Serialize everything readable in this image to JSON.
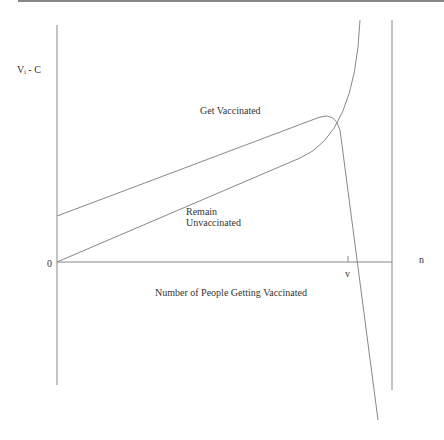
{
  "diagram": {
    "y_axis_label": "Vᵢ - C",
    "origin_label": "0",
    "x_axis_end_label": "n",
    "x_axis_title": "Number of People Getting Vaccinated",
    "tick_label": "v",
    "curves": [
      {
        "name": "Get Vaccinated",
        "label": "Get Vaccinated"
      },
      {
        "name": "Remain Unvaccinated",
        "label_line1": "Remain",
        "label_line2": "Unvaccinated"
      }
    ],
    "colors": {
      "line": "#777777",
      "text": "#333333"
    }
  }
}
